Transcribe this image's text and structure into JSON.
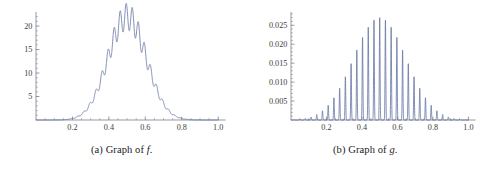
{
  "figure": {
    "panels": [
      {
        "id": "panel-a",
        "caption_prefix": "(a) Graph of ",
        "caption_var": "f",
        "caption_suffix": ".",
        "caption_full": "(a) Graph of f."
      },
      {
        "id": "panel-b",
        "caption_prefix": "(b) Graph of ",
        "caption_var": "g",
        "caption_suffix": ".",
        "caption_full": "(b) Graph of g."
      }
    ]
  },
  "style": {
    "curve_color": "#6b7ba8",
    "axis_color": "#6b6b78",
    "background": "#ffffff",
    "text_color": "#262626"
  },
  "chart_data": [
    {
      "type": "line",
      "id": "graph-f",
      "title": "(a) Graph of f.",
      "xlabel": "",
      "ylabel": "",
      "xlim": [
        0,
        1.04
      ],
      "ylim": [
        0,
        23
      ],
      "grid": false,
      "legend": null,
      "xticks": [
        0.2,
        0.4,
        0.6,
        0.8,
        1.0
      ],
      "xtick_labels": [
        "0.2",
        "0.4",
        "0.6",
        "0.8",
        "1.0"
      ],
      "yticks": [
        5,
        10,
        15,
        20
      ],
      "ytick_labels": [
        "5",
        "10",
        "15",
        "20"
      ],
      "x_minor_step": 0.05,
      "y_minor_step": 1,
      "description": "Smooth bell-shaped envelope peaking near x=0.5 at about y=22, modulated by rapid small-amplitude oscillations (about 14 visible ripple peaks across the hump); nearly zero below x=0.07 and above x=0.95.",
      "envelope_peak": 22,
      "envelope_center": 0.5,
      "envelope_width": 0.195,
      "ripple_count": 15,
      "ripple_relative_amplitude": 0.13,
      "samples_x_count": 1600
    },
    {
      "type": "line",
      "id": "graph-g",
      "title": "(b) Graph of g.",
      "xlabel": "",
      "ylabel": "",
      "xlim": [
        0,
        1.04
      ],
      "ylim": [
        0,
        0.0285
      ],
      "grid": false,
      "legend": null,
      "xticks": [
        0.2,
        0.4,
        0.6,
        0.8,
        1.0
      ],
      "xtick_labels": [
        "0.2",
        "0.4",
        "0.6",
        "0.8",
        "1.0"
      ],
      "yticks": [
        0.005,
        0.01,
        0.015,
        0.02,
        0.025
      ],
      "ytick_labels": [
        "0.005",
        "0.010",
        "0.015",
        "0.020",
        "0.025"
      ],
      "x_minor_step": 0.05,
      "y_minor_step": 0.001,
      "description": "Train of about 31 narrow sharp spikes evenly spaced across 0 to 1, whose heights follow a smooth bell envelope peaking near x=0.5 at about 0.0270; outermost spikes near x=0.02 and x=0.98 reach only about 0.001.",
      "envelope_peak": 0.027,
      "envelope_center": 0.5,
      "envelope_width": 0.26,
      "spike_count": 31,
      "spike_sharpness": 26,
      "samples_x_count": 3000
    }
  ]
}
